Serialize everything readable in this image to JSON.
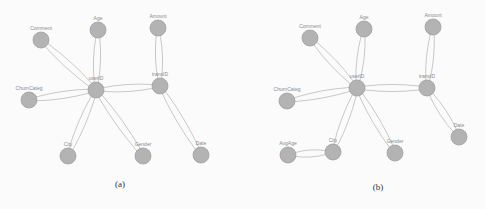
{
  "panels": [
    {
      "id": "a",
      "caption": "(a)",
      "caption_pos": [
        120,
        187
      ],
      "nodes": [
        {
          "id": "Comment",
          "label": "Comment",
          "x": 41,
          "y": 40
        },
        {
          "id": "Age",
          "label": "Age",
          "x": 98,
          "y": 30
        },
        {
          "id": "Amount",
          "label": "Amount",
          "x": 158,
          "y": 28
        },
        {
          "id": "ChurnCateg",
          "label": "ChurnCateg",
          "x": 29,
          "y": 100
        },
        {
          "id": "userID",
          "label": "userID",
          "x": 96,
          "y": 90
        },
        {
          "id": "transID",
          "label": "transID",
          "x": 160,
          "y": 86
        },
        {
          "id": "City",
          "label": "City",
          "x": 68,
          "y": 156
        },
        {
          "id": "Gender",
          "label": "Gender",
          "x": 143,
          "y": 156
        },
        {
          "id": "Date",
          "label": "Date",
          "x": 201,
          "y": 155
        }
      ],
      "edges": [
        [
          "Comment",
          "userID"
        ],
        [
          "Age",
          "userID"
        ],
        [
          "ChurnCateg",
          "userID"
        ],
        [
          "userID",
          "transID"
        ],
        [
          "Amount",
          "transID"
        ],
        [
          "userID",
          "City"
        ],
        [
          "userID",
          "Gender"
        ],
        [
          "transID",
          "Date"
        ]
      ]
    },
    {
      "id": "b",
      "caption": "(b)",
      "caption_pos": [
        378,
        190
      ],
      "nodes": [
        {
          "id": "Comment",
          "label": "Comment",
          "x": 310,
          "y": 38
        },
        {
          "id": "Age",
          "label": "Age",
          "x": 364,
          "y": 29
        },
        {
          "id": "Amount",
          "label": "Amount",
          "x": 433,
          "y": 27
        },
        {
          "id": "ChurnCateg",
          "label": "ChurnCateg",
          "x": 287,
          "y": 101
        },
        {
          "id": "userID",
          "label": "userID",
          "x": 357,
          "y": 88
        },
        {
          "id": "transID",
          "label": "transID",
          "x": 427,
          "y": 88
        },
        {
          "id": "AvgAge",
          "label": "AvgAge",
          "x": 288,
          "y": 155
        },
        {
          "id": "City",
          "label": "City",
          "x": 333,
          "y": 152
        },
        {
          "id": "Gender",
          "label": "Gender",
          "x": 395,
          "y": 153
        },
        {
          "id": "Date",
          "label": "Date",
          "x": 459,
          "y": 137
        }
      ],
      "edges": [
        [
          "Comment",
          "userID"
        ],
        [
          "Age",
          "userID"
        ],
        [
          "ChurnCateg",
          "userID"
        ],
        [
          "userID",
          "transID"
        ],
        [
          "Amount",
          "transID"
        ],
        [
          "userID",
          "City"
        ],
        [
          "userID",
          "Gender"
        ],
        [
          "transID",
          "Date"
        ],
        [
          "AvgAge",
          "City"
        ]
      ]
    }
  ],
  "style": {
    "node_fill": "#b3b3b3",
    "node_stroke": "#9f9f9f",
    "edge_color": "#c2c2c2",
    "node_radius": 8
  }
}
